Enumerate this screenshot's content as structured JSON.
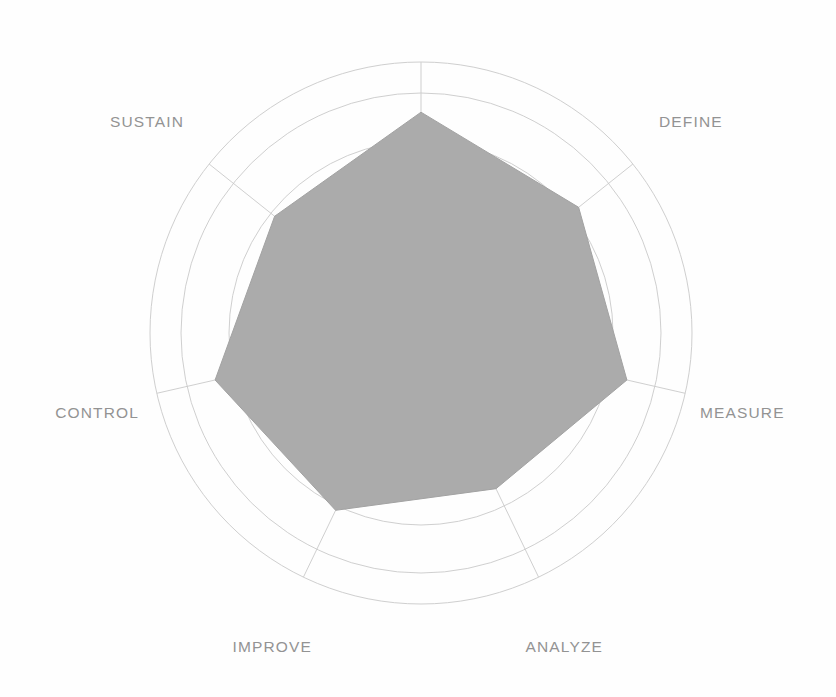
{
  "chart_data": {
    "type": "radar",
    "title": "",
    "subtitle": "",
    "xlabel": "",
    "ylabel": "",
    "categories": [
      "",
      "DEFINE",
      "MEASURE",
      "ANALYZE",
      "IMPROVE",
      "CONTROL",
      "SUSTAIN"
    ],
    "axis_labels": [
      "DEFINE",
      "MEASURE",
      "ANALYZE",
      "IMPROVE",
      "CONTROL",
      "SUSTAIN"
    ],
    "series": [
      {
        "name": "",
        "values": [
          4.6,
          4.2,
          4.4,
          3.6,
          4.1,
          4.4,
          3.9
        ]
      }
    ],
    "rmax": 5,
    "rings": 5,
    "grid": true,
    "legend": false,
    "legend_position": "none",
    "tick_labels": [],
    "colors": {
      "fill": "#ababab",
      "stroke": "#a2a2a2",
      "grid": "#c9c9c9",
      "outer_ring": "#cfcfcf",
      "label_text": "#939393",
      "background": "#fefefe"
    },
    "geometry": {
      "cx": 421,
      "cy": 333,
      "outer_radius": 271,
      "data_max_radius": 240,
      "axis_count": 7,
      "start_angle_deg": -90
    }
  },
  "labels": {
    "define": "DEFINE",
    "measure": "MEASURE",
    "analyze": "ANALYZE",
    "improve": "IMPROVE",
    "control": "CONTROL",
    "sustain": "SUSTAIN"
  },
  "label_positions": [
    {
      "key": "define",
      "x": 659,
      "y": 127,
      "anchor": "start"
    },
    {
      "key": "measure",
      "x": 700,
      "y": 418,
      "anchor": "start"
    },
    {
      "key": "analyze",
      "x": 603,
      "y": 652,
      "anchor": "end"
    },
    {
      "key": "improve",
      "x": 312,
      "y": 652,
      "anchor": "end"
    },
    {
      "key": "control",
      "x": 139,
      "y": 418,
      "anchor": "end"
    },
    {
      "key": "sustain",
      "x": 110,
      "y": 127,
      "anchor": "start"
    }
  ]
}
